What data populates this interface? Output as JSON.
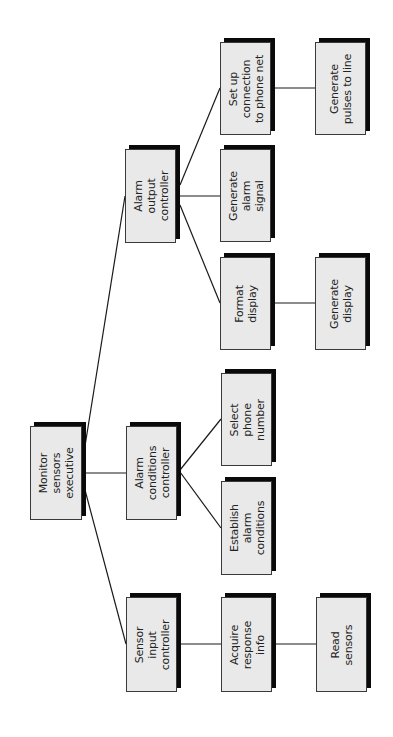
{
  "diagram": {
    "type": "hierarchy-chart",
    "orientation": "rotated-90-ccw",
    "root": "Monitor sensors executive",
    "nodes": [
      {
        "id": "monitor",
        "label": "Monitor\nsensors\nexecutive",
        "level": 0,
        "x": 30,
        "y": 426,
        "w": 52,
        "h": 94
      },
      {
        "id": "sensor-input",
        "label": "Sensor\ninput\ncontroller",
        "level": 1,
        "x": 126,
        "y": 597,
        "w": 51,
        "h": 95
      },
      {
        "id": "alarm-conditions",
        "label": "Alarm\nconditions\ncontroller",
        "level": 1,
        "x": 126,
        "y": 426,
        "w": 51,
        "h": 94
      },
      {
        "id": "alarm-output",
        "label": "Alarm\noutput\ncontroller",
        "level": 1,
        "x": 125,
        "y": 149,
        "w": 51,
        "h": 94
      },
      {
        "id": "acquire-response",
        "label": "Acquire\nresponse\ninfo",
        "level": 2,
        "x": 221,
        "y": 597,
        "w": 51,
        "h": 95
      },
      {
        "id": "establish-alarm",
        "label": "Establish\nalarm\nconditions",
        "level": 2,
        "x": 221,
        "y": 481,
        "w": 51,
        "h": 94
      },
      {
        "id": "select-phone",
        "label": "Select\nphone\nnumber",
        "level": 2,
        "x": 221,
        "y": 373,
        "w": 51,
        "h": 93
      },
      {
        "id": "format-display",
        "label": "Format\ndisplay",
        "level": 2,
        "x": 220,
        "y": 257,
        "w": 51,
        "h": 93
      },
      {
        "id": "generate-alarm",
        "label": "Generate\nalarm\nsignal",
        "level": 2,
        "x": 220,
        "y": 149,
        "w": 51,
        "h": 93
      },
      {
        "id": "setup-connection",
        "label": "Set up\nconnection\nto phone net",
        "level": 2,
        "x": 220,
        "y": 42,
        "w": 51,
        "h": 93
      },
      {
        "id": "read-sensors",
        "label": "Read\nsensors",
        "level": 3,
        "x": 316,
        "y": 597,
        "w": 51,
        "h": 95
      },
      {
        "id": "generate-display",
        "label": "Generate\ndisplay",
        "level": 3,
        "x": 315,
        "y": 257,
        "w": 51,
        "h": 93
      },
      {
        "id": "generate-pulses",
        "label": "Generate\npulses to line",
        "level": 3,
        "x": 315,
        "y": 42,
        "w": 51,
        "h": 93
      }
    ],
    "edges": [
      {
        "from": "monitor",
        "to": "alarm-output",
        "x1": 85,
        "y1": 446,
        "x2": 125,
        "y2": 196
      },
      {
        "from": "monitor",
        "to": "alarm-conditions",
        "x1": 86,
        "y1": 473,
        "x2": 126,
        "y2": 473
      },
      {
        "from": "monitor",
        "to": "sensor-input",
        "x1": 85,
        "y1": 490,
        "x2": 126,
        "y2": 644
      },
      {
        "from": "alarm-output",
        "to": "setup-connection",
        "x1": 180,
        "y1": 185,
        "x2": 220,
        "y2": 88
      },
      {
        "from": "alarm-output",
        "to": "generate-alarm",
        "x1": 180,
        "y1": 196,
        "x2": 220,
        "y2": 196
      },
      {
        "from": "alarm-output",
        "to": "format-display",
        "x1": 180,
        "y1": 205,
        "x2": 220,
        "y2": 303
      },
      {
        "from": "alarm-conditions",
        "to": "select-phone",
        "x1": 180,
        "y1": 470,
        "x2": 221,
        "y2": 419
      },
      {
        "from": "alarm-conditions",
        "to": "establish-alarm",
        "x1": 180,
        "y1": 472,
        "x2": 221,
        "y2": 528
      },
      {
        "from": "sensor-input",
        "to": "acquire-response",
        "x1": 180,
        "y1": 644,
        "x2": 221,
        "y2": 644
      },
      {
        "from": "acquire-response",
        "to": "read-sensors",
        "x1": 275,
        "y1": 644,
        "x2": 316,
        "y2": 644
      },
      {
        "from": "format-display",
        "to": "generate-display",
        "x1": 275,
        "y1": 303,
        "x2": 315,
        "y2": 303
      },
      {
        "from": "setup-connection",
        "to": "generate-pulses",
        "x1": 275,
        "y1": 88,
        "x2": 315,
        "y2": 88
      }
    ],
    "colors": {
      "box_fill": "#e9e9e9",
      "box_border": "#3a3a3a",
      "shadow": "#0a0a0a",
      "line": "#1a1a1a",
      "text": "#222222",
      "background": "#ffffff"
    }
  }
}
